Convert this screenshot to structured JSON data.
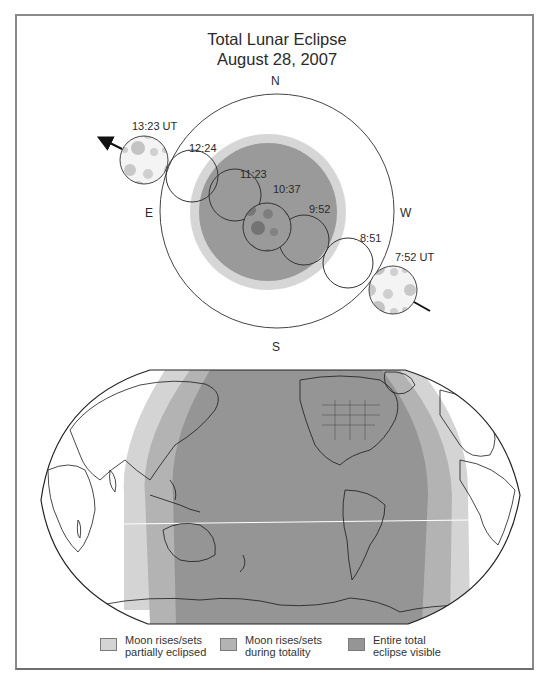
{
  "title": {
    "line1": "Total Lunar Eclipse",
    "line2": "August 28, 2007"
  },
  "compass": {
    "north": "N",
    "south": "S",
    "east": "E",
    "west": "W"
  },
  "moon_positions": [
    {
      "time": "7:52 UT",
      "phase": "start",
      "shaded": "moon-image"
    },
    {
      "time": "8:51",
      "phase": "penumbral-to-partial",
      "shaded": "none"
    },
    {
      "time": "9:52",
      "phase": "total-begins",
      "shaded": "umbra"
    },
    {
      "time": "10:37",
      "phase": "greatest-eclipse",
      "shaded": "moon-image-dark"
    },
    {
      "time": "11:23",
      "phase": "total-ends",
      "shaded": "umbra"
    },
    {
      "time": "12:24",
      "phase": "partial-ends",
      "shaded": "none"
    },
    {
      "time": "13:23 UT",
      "phase": "end",
      "shaded": "moon-image"
    }
  ],
  "colors": {
    "partial": "#d4d4d4",
    "totality_rise_set": "#b3b3b3",
    "entire_total": "#959595",
    "umbra": "#9a9a9a",
    "penumbra": "#d6d6d6",
    "outline": "#333333"
  },
  "legend": [
    {
      "line1": "Moon rises/sets",
      "line2": "partially eclipsed",
      "color": "#d4d4d4"
    },
    {
      "line1": "Moon rises/sets",
      "line2": "during totality",
      "color": "#b3b3b3"
    },
    {
      "line1": "Entire total",
      "line2": "eclipse visible",
      "color": "#959595"
    }
  ]
}
